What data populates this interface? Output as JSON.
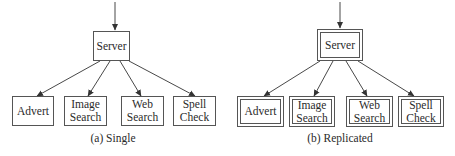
{
  "diagrams": [
    {
      "id": "single",
      "caption": "(a) Single",
      "root": {
        "label": "Server"
      },
      "children": [
        {
          "label": "Advert"
        },
        {
          "label": "Image\nSearch"
        },
        {
          "label": "Web\nSearch"
        },
        {
          "label": "Spell\nCheck"
        }
      ],
      "border_style": "single"
    },
    {
      "id": "replicated",
      "caption": "(b) Replicated",
      "root": {
        "label": "Server"
      },
      "children": [
        {
          "label": "Advert"
        },
        {
          "label": "Image\nSearch"
        },
        {
          "label": "Web\nSearch"
        },
        {
          "label": "Spell\nCheck"
        }
      ],
      "border_style": "double"
    }
  ],
  "colors": {
    "line": "#333333",
    "box_border": "#555555",
    "text": "#2a2a2a",
    "background": "#ffffff"
  }
}
